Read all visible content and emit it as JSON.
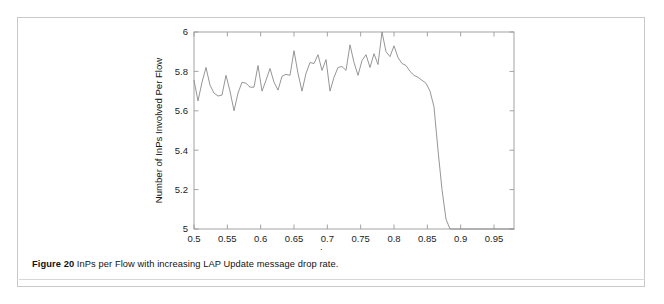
{
  "figure": {
    "caption_label": "Figure 20",
    "caption_text": " InPs per Flow with increasing LAP Update message drop rate."
  },
  "chart_data": {
    "type": "line",
    "title": "",
    "xlabel": "LAP Update Message Drop Rate",
    "ylabel": "Number of InPs Involved Per Flow",
    "xlim": [
      0.5,
      0.98
    ],
    "ylim": [
      5,
      6
    ],
    "xticks": [
      0.5,
      0.55,
      0.6,
      0.65,
      0.7,
      0.75,
      0.8,
      0.85,
      0.9,
      0.95
    ],
    "xticklabels": [
      "0.5",
      "0.55",
      "0.6",
      "0.65",
      "0.7",
      "0.75",
      "0.8",
      "0.85",
      "0.9",
      "0.95"
    ],
    "yticks": [
      5,
      5.2,
      5.4,
      5.6,
      5.8,
      6
    ],
    "yticklabels": [
      "5",
      "5.2",
      "5.4",
      "5.6",
      "5.8",
      "6"
    ],
    "grid": false,
    "legend": null,
    "line_color": "#8a8a8a",
    "series": [
      {
        "name": "InPs per Flow",
        "x": [
          0.5,
          0.506,
          0.512,
          0.518,
          0.524,
          0.53,
          0.536,
          0.542,
          0.548,
          0.554,
          0.56,
          0.566,
          0.572,
          0.578,
          0.584,
          0.59,
          0.596,
          0.602,
          0.608,
          0.614,
          0.62,
          0.626,
          0.632,
          0.638,
          0.644,
          0.65,
          0.656,
          0.662,
          0.668,
          0.674,
          0.68,
          0.686,
          0.692,
          0.698,
          0.704,
          0.71,
          0.716,
          0.722,
          0.728,
          0.734,
          0.74,
          0.746,
          0.752,
          0.758,
          0.764,
          0.77,
          0.776,
          0.782,
          0.788,
          0.794,
          0.8,
          0.806,
          0.812,
          0.818,
          0.824,
          0.83,
          0.836,
          0.842,
          0.848,
          0.854,
          0.86,
          0.866,
          0.872,
          0.878,
          0.884,
          0.89,
          0.896,
          0.902,
          0.908,
          0.914,
          0.92,
          0.926,
          0.932,
          0.938,
          0.944,
          0.95,
          0.956,
          0.962,
          0.968,
          0.974,
          0.977,
          0.98
        ],
        "y": [
          5.755,
          5.65,
          5.745,
          5.82,
          5.73,
          5.69,
          5.675,
          5.68,
          5.78,
          5.7,
          5.6,
          5.69,
          5.745,
          5.74,
          5.72,
          5.72,
          5.83,
          5.7,
          5.755,
          5.815,
          5.745,
          5.705,
          5.775,
          5.785,
          5.78,
          5.905,
          5.79,
          5.7,
          5.79,
          5.845,
          5.84,
          5.885,
          5.805,
          5.86,
          5.7,
          5.77,
          5.82,
          5.825,
          5.805,
          5.935,
          5.845,
          5.78,
          5.855,
          5.885,
          5.82,
          5.89,
          5.835,
          6.0,
          5.9,
          5.875,
          5.93,
          5.87,
          5.84,
          5.83,
          5.8,
          5.78,
          5.77,
          5.755,
          5.74,
          5.7,
          5.62,
          5.4,
          5.2,
          5.05,
          5.0,
          5.0,
          5.0,
          5.0,
          5.0,
          5.0,
          5.0,
          5.0,
          5.0,
          5.0,
          5.0,
          5.0,
          5.0,
          5.0,
          5.0,
          5.0,
          5.0,
          5.0
        ]
      }
    ]
  }
}
